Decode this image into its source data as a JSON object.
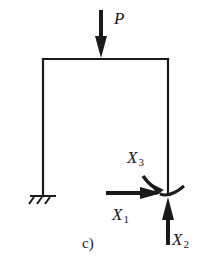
{
  "figure": {
    "caption": "c)",
    "colors": {
      "line": "#1a1a1a",
      "background": "#ffffff"
    }
  },
  "loads": {
    "P": {
      "label": "P",
      "direction": "down",
      "location": "top beam, near midspan"
    }
  },
  "redundants": {
    "X1": {
      "symbol": "X",
      "subscript": "1",
      "type": "force",
      "direction": "right"
    },
    "X2": {
      "symbol": "X",
      "subscript": "2",
      "type": "force",
      "direction": "up"
    },
    "X3": {
      "symbol": "X",
      "subscript": "3",
      "type": "moment",
      "direction": "counterclockwise arc"
    }
  },
  "supports": {
    "left": {
      "type": "fixed",
      "icon": "fixed-support-hatch"
    },
    "right": {
      "type": "released"
    }
  }
}
